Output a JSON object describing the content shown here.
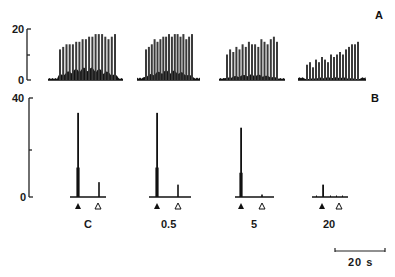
{
  "figure": {
    "panel_a_label": "A",
    "panel_b_label": "B",
    "scale_bar_label": "20 s",
    "conditions": [
      "C",
      "0.5",
      "5",
      "20"
    ]
  },
  "chart_data": [
    {
      "type": "bar",
      "panel": "A",
      "title": "",
      "xlabel": "",
      "ylabel": "",
      "ylim": [
        0,
        20
      ],
      "yticks": [
        "0",
        "20"
      ],
      "grid": false,
      "description": "Response histograms to repeated stimulation; tall regular peaks per stimulus over low background activity",
      "series": [
        {
          "name": "C",
          "values": [
            12,
            13,
            14,
            14,
            14,
            15,
            15,
            16,
            16,
            17,
            17,
            18,
            18,
            18,
            17,
            16,
            17,
            18
          ]
        },
        {
          "name": "0.5",
          "values": [
            12,
            13,
            14,
            16,
            15,
            16,
            17,
            17,
            18,
            17,
            18,
            18,
            17,
            18,
            16,
            17,
            18
          ]
        },
        {
          "name": "5",
          "values": [
            10,
            12,
            11,
            13,
            12,
            14,
            13,
            15,
            14,
            14,
            13,
            16,
            15,
            14,
            16,
            17,
            15
          ]
        },
        {
          "name": "20",
          "values": [
            6,
            7,
            5,
            8,
            7,
            9,
            8,
            7,
            10,
            9,
            10,
            11,
            10,
            12,
            13,
            14,
            14,
            15
          ]
        }
      ],
      "categories": [
        "C",
        "0.5",
        "5",
        "20"
      ]
    },
    {
      "type": "bar",
      "panel": "B",
      "title": "",
      "xlabel": "",
      "ylabel": "",
      "ylim": [
        0,
        40
      ],
      "yticks": [
        "0",
        "40"
      ],
      "grid": false,
      "description": "Response to stimulus at filled triangle (main peak) and open triangle (secondary peak)",
      "categories": [
        "C",
        "0.5",
        "5",
        "20"
      ],
      "series": [
        {
          "name": "main peak (filled triangle)",
          "values": [
            34,
            34,
            28,
            5
          ]
        },
        {
          "name": "secondary peak (open triangle)",
          "values": [
            6,
            5,
            1,
            0
          ]
        }
      ],
      "markers": {
        "filled": "▲ stimulus onset",
        "open": "△ second stimulus"
      },
      "scale_bar": "20 s"
    }
  ]
}
